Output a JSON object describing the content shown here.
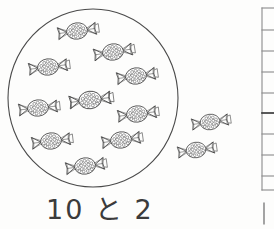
{
  "document": {
    "kind": "math-worksheet-scan",
    "subject_language": "Japanese",
    "page_background": "#fdfdfc",
    "ink_color": "#3b3b3b"
  },
  "caption": {
    "text": "10 と 2",
    "parts": {
      "quantity_inside": "10",
      "conjunction": "と",
      "quantity_outside": "2"
    }
  },
  "grouping_circle": {
    "label": "grouping-circle",
    "center_x": 93,
    "center_y": 98,
    "radius_x": 85,
    "radius_y": 89,
    "stroke": "#4a4a4a",
    "stroke_width": 1.1,
    "fill": "none"
  },
  "candy": {
    "icon_name": "candy-icon",
    "body_shape": "ellipse",
    "body_rx": 13,
    "body_ry": 10,
    "wrapper_shape": "twisted-fan",
    "dot_fill_color": "#555555",
    "outline_color": "#3b3b3b",
    "inside_count": 10,
    "outside_count": 2,
    "total_count": 12
  },
  "candies_inside": [
    {
      "name": "candy-inside-1",
      "x": 77,
      "y": 31,
      "rotate": -8
    },
    {
      "name": "candy-inside-2",
      "x": 48,
      "y": 67,
      "rotate": -7
    },
    {
      "name": "candy-inside-3",
      "x": 113,
      "y": 52,
      "rotate": -9
    },
    {
      "name": "candy-inside-4",
      "x": 136,
      "y": 76,
      "rotate": -8
    },
    {
      "name": "candy-inside-5",
      "x": 38,
      "y": 108,
      "rotate": -6
    },
    {
      "name": "candy-inside-6",
      "x": 90,
      "y": 100,
      "rotate": -7
    },
    {
      "name": "candy-inside-7",
      "x": 137,
      "y": 114,
      "rotate": -7
    },
    {
      "name": "candy-inside-8",
      "x": 51,
      "y": 141,
      "rotate": -7
    },
    {
      "name": "candy-inside-9",
      "x": 121,
      "y": 140,
      "rotate": -8
    },
    {
      "name": "candy-inside-10",
      "x": 85,
      "y": 166,
      "rotate": -8
    }
  ],
  "candies_outside": [
    {
      "name": "candy-outside-1",
      "x": 210,
      "y": 122,
      "rotate": -8
    },
    {
      "name": "candy-outside-2",
      "x": 196,
      "y": 150,
      "rotate": -8
    }
  ],
  "margin_rule": {
    "name": "page-margin-rule",
    "line_x": 262,
    "line_top": 8,
    "line_bottom": 190,
    "stroke": "#8a8a8a",
    "stroke_width": 1.1,
    "tick_length": 11,
    "tick_y_positions": [
      8,
      30,
      51,
      72,
      93,
      113,
      134,
      155,
      176,
      190
    ],
    "emphasized_tick_y": 113,
    "stub_line": {
      "x": 264,
      "top": 203,
      "bottom": 224
    }
  }
}
